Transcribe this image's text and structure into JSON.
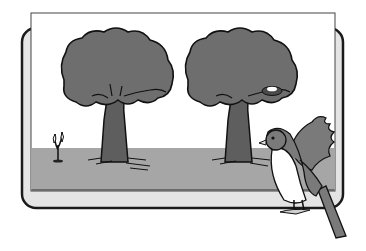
{
  "scene": {
    "description": "Illustration of two trees, one with a nest, a small sprout, and a bird perched on a picture frame",
    "colors": {
      "background": "#ffffff",
      "frame_fill": "#e4e4e4",
      "frame_stroke": "#1a1a1a",
      "sky": "#ffffff",
      "ground": "#a6a6a6",
      "foliage": "#6e6e6e",
      "trunk": "#5e5e5e",
      "bird_body": "#7a7a7a",
      "bird_belly": "#ffffff"
    },
    "elements": [
      "frame",
      "tree-left",
      "tree-right-with-nest",
      "sprout",
      "bird"
    ]
  }
}
